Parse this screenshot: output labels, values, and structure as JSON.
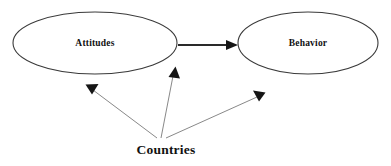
{
  "diagram": {
    "type": "moderation-path-diagram",
    "background_color": "#ffffff",
    "nodes": [
      {
        "id": "attitudes",
        "label": "Attitudes",
        "shape": "ellipse",
        "cx": 95,
        "cy": 43,
        "rx": 82,
        "ry": 31,
        "stroke_color": "#3a3a3a",
        "fill_color": "#ffffff"
      },
      {
        "id": "behavior",
        "label": "Behavior",
        "shape": "ellipse",
        "cx": 308,
        "cy": 43,
        "rx": 70,
        "ry": 31,
        "stroke_color": "#3a3a3a",
        "fill_color": "#ffffff"
      }
    ],
    "moderator": {
      "id": "countries",
      "label": "Countries",
      "x": 166,
      "y": 151,
      "color": "#111111"
    },
    "edges": [
      {
        "id": "attitudes-to-behavior",
        "from": "attitudes",
        "to": "behavior",
        "style": "solid-thick",
        "color": "#2a2a2a",
        "x1": 178,
        "y1": 45,
        "x2": 236,
        "y2": 45
      },
      {
        "id": "countries-to-attitudes",
        "from": "countries",
        "to": "attitudes",
        "style": "solid-thin",
        "color": "#7a7a7a",
        "x1": 157,
        "y1": 138,
        "x2": 88,
        "y2": 87
      },
      {
        "id": "countries-to-path",
        "from": "countries",
        "to": "attitudes-to-behavior",
        "style": "solid-thin",
        "color": "#7a7a7a",
        "x1": 161,
        "y1": 138,
        "x2": 176,
        "y2": 69
      },
      {
        "id": "countries-to-behavior-path",
        "from": "countries",
        "to": "behavior",
        "style": "solid-thin",
        "color": "#7a7a7a",
        "x1": 166,
        "y1": 138,
        "x2": 263,
        "y2": 94
      }
    ]
  }
}
